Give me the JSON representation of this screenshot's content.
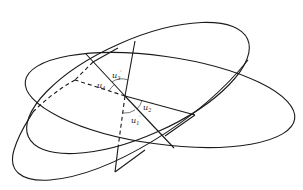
{
  "diagram": {
    "type": "geometry",
    "stroke_color": "#1a1a1a",
    "labels": {
      "u1": {
        "base": "u",
        "sub": "1",
        "prime": "'"
      },
      "u2": {
        "base": "u",
        "sub": "2",
        "prime": "'"
      },
      "u3": {
        "base": "u",
        "sub": "3",
        "prime": "'"
      },
      "u4": {
        "base": "u",
        "sub": "4",
        "prime": ""
      }
    }
  }
}
